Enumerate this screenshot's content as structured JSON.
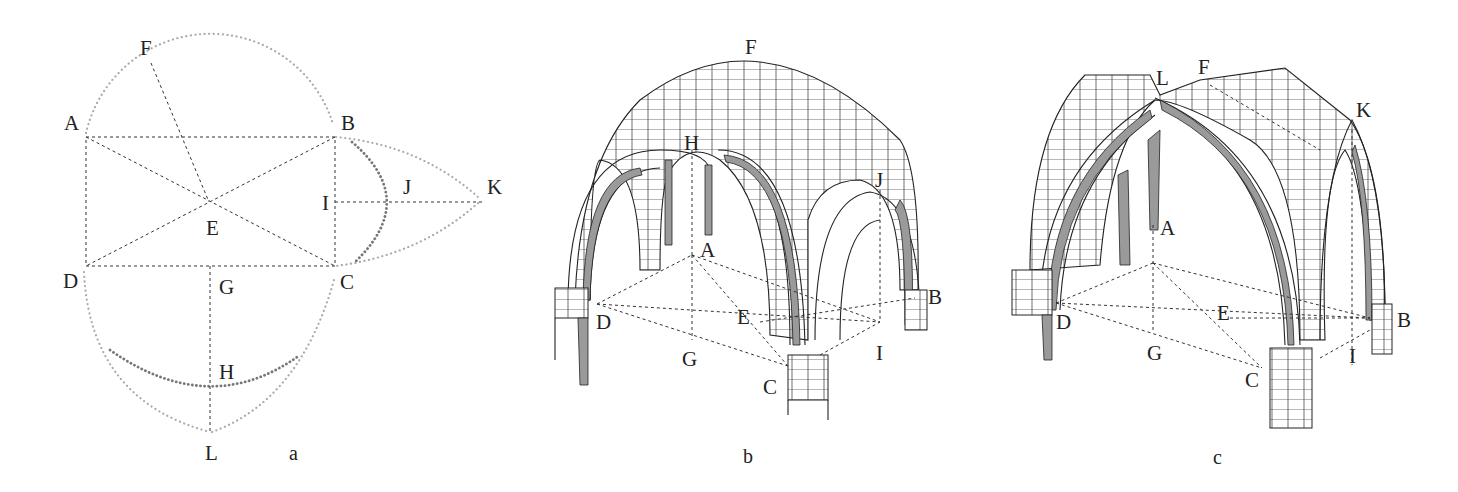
{
  "figures": [
    {
      "id": "a",
      "caption": "a",
      "description": "Plan construction of a vault bay with rectangle ABCD, diagonals crossing at E, semicircle arcs on AB and CD, pointed arc on BC to K, and dark dotted arcs through H and J",
      "labels": {
        "F": "F",
        "A": "A",
        "B": "B",
        "E": "E",
        "I": "I",
        "J": "J",
        "K": "K",
        "D": "D",
        "G": "G",
        "C": "C",
        "H": "H",
        "L": "L"
      }
    },
    {
      "id": "b",
      "caption": "b",
      "description": "Isometric drawing of a groin vault with round arches on masonry piers",
      "labels": {
        "F": "F",
        "H": "H",
        "J": "J",
        "A": "A",
        "B": "B",
        "D": "D",
        "E": "E",
        "G": "G",
        "C": "C",
        "I": "I"
      }
    },
    {
      "id": "c",
      "caption": "c",
      "description": "Isometric drawing of a ribbed vault with pointed arches on masonry piers",
      "labels": {
        "L": "L",
        "F": "F",
        "K": "K",
        "A": "A",
        "D": "D",
        "E": "E",
        "B": "B",
        "G": "G",
        "C": "C",
        "I": "I"
      }
    }
  ],
  "colors": {
    "ink": "#222222",
    "dotted_light": "#aaaaaa",
    "dotted_dark": "#777777",
    "shade": "#9a9a9a",
    "background": "#ffffff"
  }
}
